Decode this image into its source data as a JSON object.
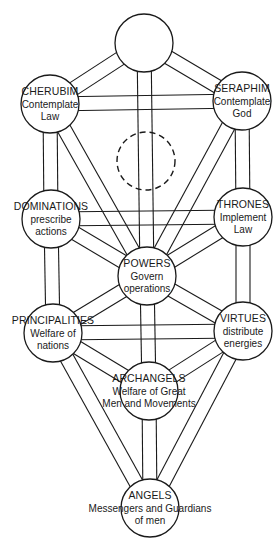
{
  "diagram": {
    "title": "",
    "colors": {
      "stroke": "#1a1a1a",
      "background": "#ffffff",
      "node_fill": "#ffffff"
    },
    "band_width": 14,
    "node_radius": 29,
    "nodes": [
      {
        "id": "top",
        "cx": 144,
        "cy": 43,
        "title": "",
        "lines": [],
        "dashed": false
      },
      {
        "id": "cherubim",
        "cx": 50,
        "cy": 104,
        "title": "CHERUBIM",
        "lines": [
          "Contemplate",
          "Law"
        ],
        "dashed": false
      },
      {
        "id": "seraphim",
        "cx": 242,
        "cy": 101,
        "title": "SERAPHIM",
        "lines": [
          "Contemplate",
          "God"
        ],
        "dashed": false
      },
      {
        "id": "hidden",
        "cx": 146,
        "cy": 161,
        "title": "",
        "lines": [],
        "dashed": true
      },
      {
        "id": "dominations",
        "cx": 51,
        "cy": 219,
        "title": "DOMINATIONS",
        "lines": [
          "prescribe",
          "actions"
        ],
        "dashed": false
      },
      {
        "id": "thrones",
        "cx": 243,
        "cy": 217,
        "title": "THRONES",
        "lines": [
          "Implement",
          "Law"
        ],
        "dashed": false
      },
      {
        "id": "powers",
        "cx": 147,
        "cy": 276,
        "title": "POWERS",
        "lines": [
          "Govern",
          "operations"
        ],
        "dashed": false
      },
      {
        "id": "principalities",
        "cx": 53,
        "cy": 333,
        "title": "PRINCIPALITIES",
        "lines": [
          "Welfare of",
          "nations"
        ],
        "dashed": false
      },
      {
        "id": "virtues",
        "cx": 243,
        "cy": 331,
        "title": "VIRTUES",
        "lines": [
          "distribute",
          "energies"
        ],
        "dashed": false
      },
      {
        "id": "archangels",
        "cx": 149,
        "cy": 391,
        "title": "ARCHANGELS",
        "lines": [
          "Welfare of Great",
          "Men and Movements"
        ],
        "dashed": false
      },
      {
        "id": "angels",
        "cx": 150,
        "cy": 508,
        "title": "ANGELS",
        "lines": [
          "Messengers and Guardians",
          "of men"
        ],
        "dashed": false
      }
    ],
    "paths": [
      [
        "top",
        "cherubim"
      ],
      [
        "top",
        "seraphim"
      ],
      [
        "top",
        "powers"
      ],
      [
        "cherubim",
        "seraphim"
      ],
      [
        "cherubim",
        "dominations"
      ],
      [
        "cherubim",
        "powers"
      ],
      [
        "seraphim",
        "thrones"
      ],
      [
        "seraphim",
        "powers"
      ],
      [
        "dominations",
        "thrones"
      ],
      [
        "dominations",
        "powers"
      ],
      [
        "thrones",
        "powers"
      ],
      [
        "dominations",
        "principalities"
      ],
      [
        "thrones",
        "virtues"
      ],
      [
        "powers",
        "principalities"
      ],
      [
        "powers",
        "virtues"
      ],
      [
        "powers",
        "archangels"
      ],
      [
        "principalities",
        "virtues"
      ],
      [
        "principalities",
        "archangels"
      ],
      [
        "virtues",
        "archangels"
      ],
      [
        "principalities",
        "angels"
      ],
      [
        "virtues",
        "angels"
      ],
      [
        "archangels",
        "angels"
      ]
    ]
  }
}
